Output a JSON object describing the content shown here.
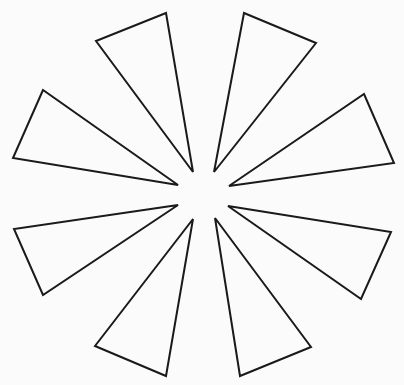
{
  "diagram": {
    "title": "",
    "background": "#fbfbfb",
    "stroke_color": "#1a1a1a",
    "stroke_width": 2,
    "width": 404,
    "height": 385,
    "shapes": [
      {
        "name": "triangle-top-left",
        "points": [
          [
            166,
            13
          ],
          [
            96,
            41
          ],
          [
            193,
            172
          ]
        ]
      },
      {
        "name": "triangle-top-right",
        "points": [
          [
            244,
            13
          ],
          [
            316,
            43
          ],
          [
            214,
            172
          ]
        ]
      },
      {
        "name": "triangle-left-upper",
        "points": [
          [
            43,
            90
          ],
          [
            13,
            158
          ],
          [
            178,
            185
          ]
        ]
      },
      {
        "name": "triangle-right-upper",
        "points": [
          [
            364,
            94
          ],
          [
            394,
            163
          ],
          [
            229,
            186
          ]
        ]
      },
      {
        "name": "triangle-left-lower",
        "points": [
          [
            178,
            205
          ],
          [
            14,
            229
          ],
          [
            43,
            295
          ]
        ]
      },
      {
        "name": "triangle-right-lower",
        "points": [
          [
            228,
            206
          ],
          [
            391,
            232
          ],
          [
            361,
            299
          ]
        ]
      },
      {
        "name": "triangle-bottom-left",
        "points": [
          [
            193,
            219
          ],
          [
            95,
            346
          ],
          [
            166,
            376
          ]
        ]
      },
      {
        "name": "triangle-bottom-right",
        "points": [
          [
            215,
            218
          ],
          [
            311,
            347
          ],
          [
            240,
            376
          ]
        ]
      }
    ]
  }
}
